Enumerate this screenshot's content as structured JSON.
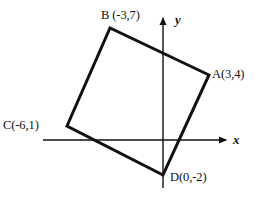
{
  "figure": {
    "kind": "coordinate-plane-quadrilateral",
    "title": "",
    "stroke_color": "#111111",
    "axis_color": "#111111",
    "background_color": "#ffffff",
    "shape_stroke_width": 3,
    "axis_stroke_width": 1.4
  },
  "axes": {
    "x_label": "x",
    "y_label": "y",
    "origin_px": {
      "x": 163,
      "y": 140
    },
    "units_per_pixel": 0.0571,
    "pixels_per_unit": 17.5,
    "x_axis_px": {
      "x1": 43,
      "y1": 140,
      "x2": 230,
      "y2": 140
    },
    "y_axis_px": {
      "x1": 163,
      "y1": 188,
      "x2": 163,
      "y2": 13
    },
    "x_arrow": "right",
    "y_arrow": "up",
    "grid": false,
    "tick_labels": []
  },
  "vertices": [
    {
      "id": "A",
      "label": "A(3,4)",
      "x": 3,
      "y": 4,
      "px": {
        "x": 209,
        "y": 75
      }
    },
    {
      "id": "B",
      "label": "B (-3,7)",
      "x": -3,
      "y": 7,
      "px": {
        "x": 110,
        "y": 28
      }
    },
    {
      "id": "C",
      "label": "C(-6,1)",
      "x": -6,
      "y": 1,
      "px": {
        "x": 67,
        "y": 126
      }
    },
    {
      "id": "D",
      "label": "D(0,-2)",
      "x": 0,
      "y": -2,
      "px": {
        "x": 163,
        "y": 175
      }
    }
  ],
  "polygon": {
    "order": [
      "A",
      "B",
      "C",
      "D"
    ],
    "closed": true,
    "filled": false
  },
  "chart_data": {
    "type": "scatter",
    "title": "",
    "xlabel": "x",
    "ylabel": "y",
    "grid": false,
    "legend": null,
    "xlim": [
      -7,
      4
    ],
    "ylim": [
      -3,
      8
    ],
    "series": [
      {
        "name": "quadrilateral ABCD",
        "point_labels": [
          "A(3,4)",
          "B (-3,7)",
          "C(-6,1)",
          "D(0,-2)"
        ],
        "x": [
          3,
          -3,
          -6,
          0
        ],
        "y": [
          4,
          7,
          1,
          -2
        ],
        "closed": true
      }
    ]
  }
}
